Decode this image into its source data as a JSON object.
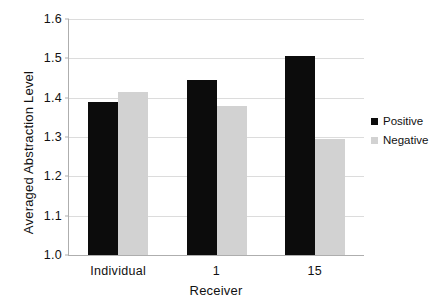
{
  "chart_data": {
    "type": "bar",
    "title": "",
    "xlabel": "Receiver",
    "ylabel": "Averaged Abstraction Level",
    "categories": [
      "Individual",
      "1",
      "15"
    ],
    "series": [
      {
        "name": "Positive",
        "color": "#0c0c0c",
        "values": [
          1.39,
          1.445,
          1.505
        ]
      },
      {
        "name": "Negative",
        "color": "#d2d2d2",
        "values": [
          1.415,
          1.38,
          1.295
        ]
      }
    ],
    "ylim": [
      1.0,
      1.6
    ],
    "ytick_labels": [
      "1.6",
      "1.5",
      "1.4",
      "1.3",
      "1.2",
      "1.1",
      "1.0"
    ],
    "ytick_values": [
      1.6,
      1.5,
      1.4,
      1.3,
      1.2,
      1.1,
      1.0
    ],
    "grid": "horizontal",
    "legend_position": "right",
    "legend_entries": [
      "Positive",
      "Negative"
    ]
  }
}
